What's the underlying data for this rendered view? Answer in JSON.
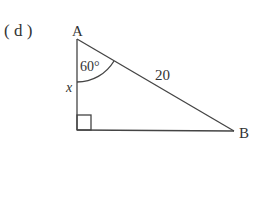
{
  "problem": {
    "label": "( d )"
  },
  "triangle": {
    "vertex_a": "A",
    "vertex_b": "B",
    "angle_a": "60°",
    "hypotenuse": "20",
    "side_x": "x",
    "right_angle_at": "bottom-left vertex"
  },
  "colors": {
    "stroke": "#444444",
    "text": "#333333"
  }
}
